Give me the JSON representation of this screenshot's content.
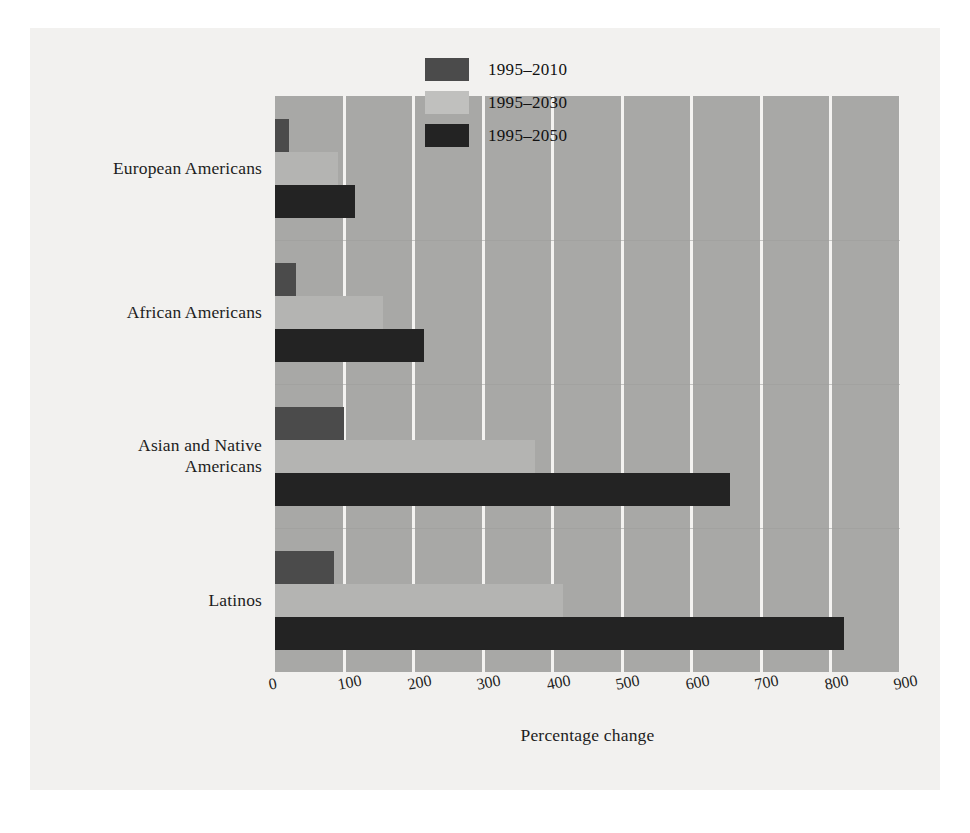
{
  "chart_data": {
    "type": "bar",
    "orientation": "horizontal",
    "title": "",
    "xlabel": "Percentage change",
    "ylabel": "",
    "xlim": [
      0,
      900
    ],
    "xticks": [
      0,
      100,
      200,
      300,
      400,
      500,
      600,
      700,
      800,
      900
    ],
    "xtick_labels": [
      "0",
      "100",
      "200",
      "300",
      "400",
      "500",
      "600",
      "700",
      "800",
      "900"
    ],
    "grid": "vertical",
    "legend_position": "top-right-inside",
    "categories": [
      "European Americans",
      "African Americans",
      "Asian and Native Americans",
      "Latinos"
    ],
    "category_lines": [
      [
        "European Americans"
      ],
      [
        "African Americans"
      ],
      [
        "Asian and Native",
        "Americans"
      ],
      [
        "Latinos"
      ]
    ],
    "series": [
      {
        "name": "1995–2010",
        "color": "#4b4b4b",
        "values": [
          20,
          30,
          100,
          85
        ]
      },
      {
        "name": "1995–2030",
        "color": "#b4b4b2",
        "values": [
          90,
          155,
          375,
          415
        ]
      },
      {
        "name": "1995–2050",
        "color": "#232323",
        "values": [
          115,
          215,
          655,
          820
        ]
      }
    ]
  },
  "legend": {
    "items": [
      {
        "label": "1995–2010"
      },
      {
        "label": "1995–2030"
      },
      {
        "label": "1995–2050"
      }
    ]
  },
  "axis": {
    "x_title": "Percentage change"
  },
  "colors": {
    "plot_background": "#a8a8a6",
    "page_background": "#f2f1ef",
    "gridline": "#f4f3f1",
    "series_1995_2010": "#4b4b4b",
    "series_1995_2030": "#b4b4b2",
    "series_1995_2050": "#232323",
    "text": "#1d1d1d"
  }
}
